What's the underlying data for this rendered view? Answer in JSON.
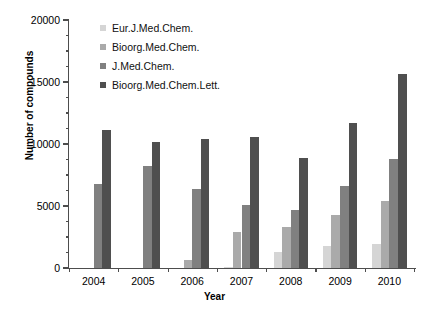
{
  "chart_data": {
    "type": "bar",
    "title": "",
    "xlabel": "Year",
    "ylabel": "Number of compounds",
    "categories": [
      "2004",
      "2005",
      "2006",
      "2007",
      "2008",
      "2009",
      "2010"
    ],
    "ylim": [
      0,
      20000
    ],
    "ytick_labels": [
      "0",
      "5000",
      "10000",
      "15000",
      "20000"
    ],
    "ytick_values": [
      0,
      5000,
      10000,
      15000,
      20000
    ],
    "yminor_step": 1250,
    "grid": false,
    "legend_position": "top-left-inside",
    "series": [
      {
        "name": "Eur.J.Med.Chem.",
        "color": "#d5d5d5",
        "values": [
          0,
          0,
          0,
          50,
          1300,
          1750,
          1900
        ]
      },
      {
        "name": "Bioorg.Med.Chem.",
        "color": "#aaaaaa",
        "values": [
          0,
          0,
          650,
          2900,
          3300,
          4300,
          5400
        ]
      },
      {
        "name": "J.Med.Chem.",
        "color": "#808080",
        "values": [
          6750,
          8200,
          6400,
          5100,
          4700,
          6600,
          8800
        ]
      },
      {
        "name": "Bioorg.Med.Chem.Lett.",
        "color": "#4f4f4f",
        "values": [
          11150,
          10200,
          10400,
          10550,
          8900,
          11700,
          15650
        ]
      }
    ]
  }
}
